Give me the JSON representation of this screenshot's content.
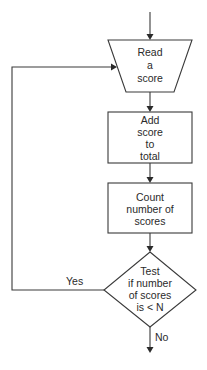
{
  "flowchart": {
    "nodes": [
      {
        "id": "read",
        "type": "input-trapezoid",
        "lines": [
          "Read",
          "a",
          "score"
        ]
      },
      {
        "id": "add",
        "type": "process",
        "lines": [
          "Add",
          "score",
          "to",
          "total"
        ]
      },
      {
        "id": "count",
        "type": "process",
        "lines": [
          "Count",
          "number of",
          "scores"
        ]
      },
      {
        "id": "test",
        "type": "decision",
        "lines": [
          "Test",
          "if number",
          "of scores",
          "is < N"
        ]
      }
    ],
    "edges": [
      {
        "from": "entry",
        "to": "read",
        "label": ""
      },
      {
        "from": "read",
        "to": "add",
        "label": ""
      },
      {
        "from": "add",
        "to": "count",
        "label": ""
      },
      {
        "from": "count",
        "to": "test",
        "label": ""
      },
      {
        "from": "test",
        "to": "read",
        "label": "Yes"
      },
      {
        "from": "test",
        "to": "exit",
        "label": "No"
      }
    ],
    "labels": {
      "yes": "Yes",
      "no": "No"
    }
  }
}
